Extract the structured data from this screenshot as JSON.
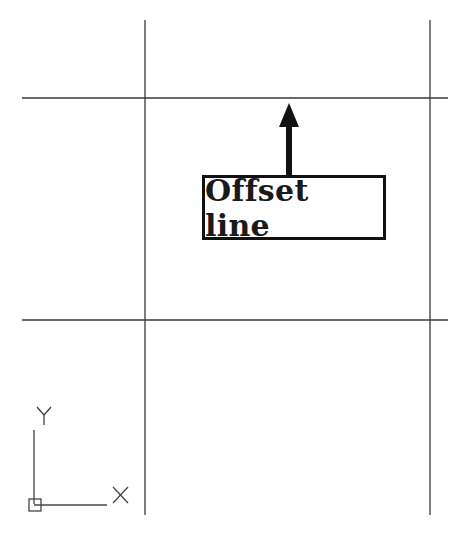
{
  "diagram": {
    "callout": {
      "label": "Offset line"
    },
    "ucs_icon": {
      "x_label": "X",
      "y_label": "Y"
    },
    "colors": {
      "line": "#3a3a3a",
      "arrow": "#111111",
      "box_border": "#111111"
    },
    "lines": {
      "horizontal": [
        {
          "name": "offset-line",
          "y": 98,
          "x1": 22,
          "x2": 448
        },
        {
          "name": "base-line",
          "y": 320,
          "x1": 22,
          "x2": 448
        }
      ],
      "vertical": [
        {
          "name": "left-vertical",
          "x": 145,
          "y1": 20,
          "y2": 515
        },
        {
          "name": "right-vertical",
          "x": 430,
          "y1": 20,
          "y2": 515
        }
      ]
    }
  }
}
